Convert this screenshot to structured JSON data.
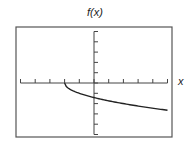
{
  "chart_data": {
    "type": "line",
    "title": "f(x)",
    "xlabel": "x",
    "ylabel": "f(x)",
    "xlim": [
      -5,
      5
    ],
    "ylim": [
      -5,
      5
    ],
    "x_ticks": [
      -5,
      -4,
      -3,
      -2,
      -1,
      0,
      1,
      2,
      3,
      4,
      5
    ],
    "y_ticks": [
      -5,
      -4,
      -3,
      -2,
      -1,
      0,
      1,
      2,
      3,
      4,
      5
    ],
    "tick_labels_shown": false,
    "grid": false,
    "legend": null,
    "series": [
      {
        "name": "f(x)",
        "function_estimate": "-sqrt(x+2)",
        "x": [
          -2,
          -1.5,
          -1,
          -0.5,
          0,
          0.5,
          1,
          1.5,
          2,
          2.5,
          3,
          3.5,
          4,
          4.5,
          5
        ],
        "y": [
          0,
          -0.71,
          -1.0,
          -1.22,
          -1.41,
          -1.58,
          -1.73,
          -1.87,
          -2.0,
          -2.12,
          -2.24,
          -2.35,
          -2.45,
          -2.55,
          -2.65
        ]
      }
    ]
  },
  "colors": {
    "frame": "#555555",
    "axis": "#444444",
    "curve": "#222222",
    "background": "#ffffff"
  }
}
